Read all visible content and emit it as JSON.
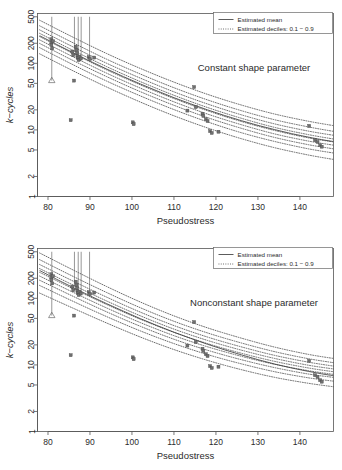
{
  "chart_data": [
    {
      "type": "scatter",
      "panel_id": "constant-shape",
      "title": "",
      "annotation": "Constant shape parameter",
      "xlabel": "Pseudostress",
      "ylabel": "k−cycles",
      "xlim": [
        77.5,
        148
      ],
      "ylim": [
        1,
        560
      ],
      "yscale": "log",
      "xticks": [
        80,
        90,
        100,
        110,
        120,
        130,
        140
      ],
      "yticks": [
        1,
        2,
        5,
        10,
        20,
        50,
        100,
        200,
        500
      ],
      "xticklabels": [
        "80",
        "90",
        "100",
        "110",
        "120",
        "130",
        "140"
      ],
      "yticklabels": [
        "1",
        "2",
        "5",
        "10",
        "20",
        "50",
        "100",
        "200",
        "500"
      ],
      "grid": false,
      "legend_position": "top-right",
      "legend": [
        {
          "label": "Estimated mean",
          "style": "solid"
        },
        {
          "label": "Estimated deciles: 0.1 − 0.9",
          "style": "dotted"
        }
      ],
      "series": [
        {
          "name": "Estimated mean",
          "style": "solid",
          "x": [
            78.0,
            82.0,
            86.0,
            90.0,
            94.0,
            98.0,
            102.0,
            106.0,
            110.0,
            114.0,
            118.0,
            122.0,
            126.0,
            130.0,
            134.0,
            138.0,
            142.0,
            146.0,
            148.0
          ],
          "y": [
            260.0,
            193.0,
            144.0,
            108.0,
            82.0,
            63.0,
            49.0,
            38.5,
            30.5,
            24.6,
            20.0,
            16.5,
            13.8,
            11.7,
            10.1,
            8.8,
            7.8,
            7.0,
            6.7
          ]
        },
        {
          "name": "Decile 0.1",
          "style": "dotted",
          "x": [
            78.0,
            86.0,
            94.0,
            102.0,
            110.0,
            118.0,
            126.0,
            134.0,
            142.0,
            148.0
          ],
          "y": [
            139.0,
            77.0,
            44.0,
            26.2,
            16.3,
            10.7,
            7.4,
            5.4,
            4.2,
            3.6
          ]
        },
        {
          "name": "Decile 0.2",
          "style": "dotted",
          "x": [
            78.0,
            86.0,
            94.0,
            102.0,
            110.0,
            118.0,
            126.0,
            134.0,
            142.0,
            148.0
          ],
          "y": [
            172.0,
            95.0,
            54.0,
            32.4,
            20.2,
            13.2,
            9.1,
            6.7,
            5.2,
            4.5
          ]
        },
        {
          "name": "Decile 0.3",
          "style": "dotted",
          "x": [
            78.0,
            86.0,
            94.0,
            102.0,
            110.0,
            118.0,
            126.0,
            134.0,
            142.0,
            148.0
          ],
          "y": [
            199.0,
            110.0,
            63.0,
            37.5,
            23.4,
            15.3,
            10.6,
            7.7,
            6.0,
            5.2
          ]
        },
        {
          "name": "Decile 0.4",
          "style": "dotted",
          "x": [
            78.0,
            86.0,
            94.0,
            102.0,
            110.0,
            118.0,
            126.0,
            134.0,
            142.0,
            148.0
          ],
          "y": [
            225.0,
            125.0,
            71.0,
            42.4,
            26.4,
            17.3,
            12.0,
            8.7,
            6.8,
            5.9
          ]
        },
        {
          "name": "Decile 0.5",
          "style": "dotted",
          "x": [
            78.0,
            86.0,
            94.0,
            102.0,
            110.0,
            118.0,
            126.0,
            134.0,
            142.0,
            148.0
          ],
          "y": [
            252.0,
            140.0,
            79.5,
            47.5,
            29.6,
            19.4,
            13.4,
            9.8,
            7.6,
            6.6
          ]
        },
        {
          "name": "Decile 0.6",
          "style": "dotted",
          "x": [
            78.0,
            86.0,
            94.0,
            102.0,
            110.0,
            118.0,
            126.0,
            134.0,
            142.0,
            148.0
          ],
          "y": [
            282.0,
            156.0,
            89.0,
            53.1,
            33.1,
            21.7,
            15.0,
            10.9,
            8.5,
            7.3
          ]
        },
        {
          "name": "Decile 0.7",
          "style": "dotted",
          "x": [
            78.0,
            86.0,
            94.0,
            102.0,
            110.0,
            118.0,
            126.0,
            134.0,
            142.0,
            148.0
          ],
          "y": [
            318.0,
            176.0,
            100.0,
            59.9,
            37.3,
            24.5,
            16.9,
            12.3,
            9.6,
            8.3
          ]
        },
        {
          "name": "Decile 0.8",
          "style": "dotted",
          "x": [
            78.0,
            86.0,
            94.0,
            102.0,
            110.0,
            118.0,
            126.0,
            134.0,
            142.0,
            148.0
          ],
          "y": [
            366.0,
            203.0,
            115.0,
            69.0,
            43.0,
            28.2,
            19.5,
            14.2,
            11.1,
            9.5
          ]
        },
        {
          "name": "Decile 0.9",
          "style": "dotted",
          "x": [
            78.0,
            86.0,
            94.0,
            102.0,
            110.0,
            118.0,
            126.0,
            134.0,
            142.0,
            148.0
          ],
          "y": [
            444.0,
            246.0,
            140.0,
            83.7,
            52.2,
            34.2,
            23.7,
            17.3,
            13.5,
            11.6
          ]
        }
      ],
      "points": [
        {
          "x": 80.8,
          "y": 230.0
        },
        {
          "x": 80.8,
          "y": 205.0
        },
        {
          "x": 80.8,
          "y": 190.0
        },
        {
          "x": 81.0,
          "y": 168.0
        },
        {
          "x": 81.2,
          "y": 215.0
        },
        {
          "x": 85.4,
          "y": 14.0
        },
        {
          "x": 85.8,
          "y": 150.0
        },
        {
          "x": 86.0,
          "y": 132.0
        },
        {
          "x": 86.2,
          "y": 55.0
        },
        {
          "x": 86.6,
          "y": 178.0
        },
        {
          "x": 86.8,
          "y": 160.0
        },
        {
          "x": 86.9,
          "y": 143.0
        },
        {
          "x": 87.0,
          "y": 128.0
        },
        {
          "x": 87.1,
          "y": 120.0
        },
        {
          "x": 87.3,
          "y": 112.0
        },
        {
          "x": 87.5,
          "y": 126.0
        },
        {
          "x": 87.8,
          "y": 118.0
        },
        {
          "x": 89.7,
          "y": 124.0
        },
        {
          "x": 90.0,
          "y": 116.0
        },
        {
          "x": 91.0,
          "y": 122.0
        },
        {
          "x": 100.2,
          "y": 13.0
        },
        {
          "x": 100.4,
          "y": 12.2
        },
        {
          "x": 114.8,
          "y": 44.0
        },
        {
          "x": 115.2,
          "y": 22.0
        },
        {
          "x": 113.2,
          "y": 19.5
        },
        {
          "x": 116.8,
          "y": 17.5
        },
        {
          "x": 117.0,
          "y": 16.2
        },
        {
          "x": 117.6,
          "y": 14.5
        },
        {
          "x": 118.0,
          "y": 13.6
        },
        {
          "x": 118.6,
          "y": 9.6
        },
        {
          "x": 119.0,
          "y": 9.0
        },
        {
          "x": 120.6,
          "y": 9.4
        },
        {
          "x": 142.2,
          "y": 11.5
        },
        {
          "x": 143.6,
          "y": 7.0
        },
        {
          "x": 144.2,
          "y": 6.6
        },
        {
          "x": 144.8,
          "y": 5.9
        },
        {
          "x": 145.2,
          "y": 5.6
        }
      ],
      "censor_lines": [
        {
          "x": 80.9,
          "y_low": 55.0,
          "y_high": 500.0,
          "marker": "triangle"
        },
        {
          "x": 86.3,
          "y_low": 150.0,
          "y_high": 500.0,
          "marker": "none"
        },
        {
          "x": 87.2,
          "y_low": 143.0,
          "y_high": 500.0,
          "marker": "none"
        },
        {
          "x": 87.9,
          "y_low": 128.0,
          "y_high": 500.0,
          "marker": "none"
        },
        {
          "x": 89.9,
          "y_low": 124.0,
          "y_high": 500.0,
          "marker": "none"
        }
      ]
    },
    {
      "type": "scatter",
      "panel_id": "nonconstant-shape",
      "title": "",
      "annotation": "Nonconstant shape parameter",
      "xlabel": "Pseudostress",
      "ylabel": "k−cycles",
      "xlim": [
        77.5,
        148
      ],
      "ylim": [
        1,
        560
      ],
      "yscale": "log",
      "xticks": [
        80,
        90,
        100,
        110,
        120,
        130,
        140
      ],
      "yticks": [
        1,
        2,
        5,
        10,
        20,
        50,
        100,
        200,
        500
      ],
      "xticklabels": [
        "80",
        "90",
        "100",
        "110",
        "120",
        "130",
        "140"
      ],
      "yticklabels": [
        "1",
        "2",
        "5",
        "10",
        "20",
        "50",
        "100",
        "200",
        "500"
      ],
      "grid": false,
      "legend_position": "top-right",
      "legend": [
        {
          "label": "Estimated mean",
          "style": "solid"
        },
        {
          "label": "Estimated deciles: 0.1 − 0.9",
          "style": "dotted"
        }
      ],
      "series": [
        {
          "name": "Estimated mean",
          "style": "solid",
          "x": [
            78.0,
            82.0,
            86.0,
            90.0,
            94.0,
            98.0,
            102.0,
            106.0,
            110.0,
            114.0,
            118.0,
            122.0,
            126.0,
            130.0,
            134.0,
            138.0,
            142.0,
            146.0,
            148.0
          ],
          "y": [
            262.0,
            194.0,
            145.0,
            109.0,
            83.0,
            64.0,
            49.5,
            39.0,
            31.0,
            25.0,
            20.4,
            16.9,
            14.2,
            12.0,
            10.3,
            9.0,
            8.0,
            7.2,
            6.9
          ]
        },
        {
          "name": "Decile 0.1",
          "style": "dotted",
          "x": [
            78.0,
            86.0,
            94.0,
            102.0,
            110.0,
            118.0,
            126.0,
            134.0,
            142.0,
            148.0
          ],
          "y": [
            120.0,
            71.0,
            42.5,
            26.2,
            17.0,
            11.7,
            8.5,
            6.5,
            5.3,
            4.7
          ]
        },
        {
          "name": "Decile 0.2",
          "style": "dotted",
          "x": [
            78.0,
            86.0,
            94.0,
            102.0,
            110.0,
            118.0,
            126.0,
            134.0,
            142.0,
            148.0
          ],
          "y": [
            156.0,
            90.0,
            53.0,
            32.4,
            20.9,
            14.3,
            10.4,
            7.9,
            6.4,
            5.7
          ]
        },
        {
          "name": "Decile 0.3",
          "style": "dotted",
          "x": [
            78.0,
            86.0,
            94.0,
            102.0,
            110.0,
            118.0,
            126.0,
            134.0,
            142.0,
            148.0
          ],
          "y": [
            187.0,
            107.0,
            62.5,
            38.0,
            24.3,
            16.6,
            12.0,
            9.1,
            7.3,
            6.5
          ]
        },
        {
          "name": "Decile 0.4",
          "style": "dotted",
          "x": [
            78.0,
            86.0,
            94.0,
            102.0,
            110.0,
            118.0,
            126.0,
            134.0,
            142.0,
            148.0
          ],
          "y": [
            216.0,
            123.0,
            71.5,
            43.2,
            27.5,
            18.7,
            13.5,
            10.2,
            8.2,
            7.2
          ]
        },
        {
          "name": "Decile 0.5",
          "style": "dotted",
          "x": [
            78.0,
            86.0,
            94.0,
            102.0,
            110.0,
            118.0,
            126.0,
            134.0,
            142.0,
            148.0
          ],
          "y": [
            246.0,
            139.0,
            80.5,
            48.5,
            30.8,
            20.9,
            15.0,
            11.3,
            9.0,
            7.9
          ]
        },
        {
          "name": "Decile 0.6",
          "style": "dotted",
          "x": [
            78.0,
            86.0,
            94.0,
            102.0,
            110.0,
            118.0,
            126.0,
            134.0,
            142.0,
            148.0
          ],
          "y": [
            280.0,
            158.0,
            91.0,
            54.6,
            34.5,
            23.3,
            16.7,
            12.5,
            9.9,
            8.7
          ]
        },
        {
          "name": "Decile 0.7",
          "style": "dotted",
          "x": [
            78.0,
            86.0,
            94.0,
            102.0,
            110.0,
            118.0,
            126.0,
            134.0,
            142.0,
            148.0
          ],
          "y": [
            322.0,
            181.0,
            104.0,
            62.0,
            39.0,
            26.2,
            18.7,
            13.9,
            11.0,
            9.6
          ]
        },
        {
          "name": "Decile 0.8",
          "style": "dotted",
          "x": [
            78.0,
            86.0,
            94.0,
            102.0,
            110.0,
            118.0,
            126.0,
            134.0,
            142.0,
            148.0
          ],
          "y": [
            381.0,
            213.0,
            122.0,
            72.2,
            45.2,
            30.2,
            21.4,
            15.8,
            12.4,
            10.8
          ]
        },
        {
          "name": "Decile 0.9",
          "style": "dotted",
          "x": [
            78.0,
            86.0,
            94.0,
            102.0,
            110.0,
            118.0,
            126.0,
            134.0,
            142.0,
            148.0
          ],
          "y": [
            480.0,
            266.0,
            150.0,
            88.0,
            54.5,
            36.0,
            25.3,
            18.5,
            14.4,
            12.5
          ]
        }
      ],
      "points": [
        {
          "x": 80.8,
          "y": 230.0
        },
        {
          "x": 80.8,
          "y": 205.0
        },
        {
          "x": 80.8,
          "y": 190.0
        },
        {
          "x": 81.0,
          "y": 168.0
        },
        {
          "x": 81.2,
          "y": 215.0
        },
        {
          "x": 85.4,
          "y": 14.0
        },
        {
          "x": 85.8,
          "y": 150.0
        },
        {
          "x": 86.0,
          "y": 132.0
        },
        {
          "x": 86.2,
          "y": 55.0
        },
        {
          "x": 86.6,
          "y": 178.0
        },
        {
          "x": 86.8,
          "y": 160.0
        },
        {
          "x": 86.9,
          "y": 143.0
        },
        {
          "x": 87.0,
          "y": 128.0
        },
        {
          "x": 87.1,
          "y": 120.0
        },
        {
          "x": 87.3,
          "y": 112.0
        },
        {
          "x": 87.5,
          "y": 126.0
        },
        {
          "x": 87.8,
          "y": 118.0
        },
        {
          "x": 89.7,
          "y": 124.0
        },
        {
          "x": 90.0,
          "y": 116.0
        },
        {
          "x": 91.0,
          "y": 122.0
        },
        {
          "x": 100.2,
          "y": 13.0
        },
        {
          "x": 100.4,
          "y": 12.2
        },
        {
          "x": 114.8,
          "y": 44.0
        },
        {
          "x": 115.2,
          "y": 22.0
        },
        {
          "x": 113.2,
          "y": 19.5
        },
        {
          "x": 116.8,
          "y": 17.5
        },
        {
          "x": 117.0,
          "y": 16.2
        },
        {
          "x": 117.6,
          "y": 14.5
        },
        {
          "x": 118.0,
          "y": 13.6
        },
        {
          "x": 118.6,
          "y": 9.6
        },
        {
          "x": 119.0,
          "y": 9.0
        },
        {
          "x": 120.6,
          "y": 9.4
        },
        {
          "x": 142.2,
          "y": 11.5
        },
        {
          "x": 143.6,
          "y": 7.0
        },
        {
          "x": 144.2,
          "y": 6.6
        },
        {
          "x": 144.8,
          "y": 5.9
        },
        {
          "x": 145.2,
          "y": 5.6
        }
      ],
      "censor_lines": [
        {
          "x": 80.9,
          "y_low": 55.0,
          "y_high": 500.0,
          "marker": "triangle"
        },
        {
          "x": 86.3,
          "y_low": 150.0,
          "y_high": 500.0,
          "marker": "none"
        },
        {
          "x": 87.2,
          "y_low": 143.0,
          "y_high": 500.0,
          "marker": "none"
        },
        {
          "x": 87.9,
          "y_low": 128.0,
          "y_high": 500.0,
          "marker": "none"
        },
        {
          "x": 89.9,
          "y_low": 124.0,
          "y_high": 500.0,
          "marker": "none"
        }
      ]
    }
  ],
  "colors": {
    "mean_curve": "#4a4a4a",
    "decile_curve": "#3a3a3a",
    "point_fill": "#6f6f6f",
    "axis": "#555555",
    "text": "#2b2b2b",
    "background": "#ffffff"
  }
}
